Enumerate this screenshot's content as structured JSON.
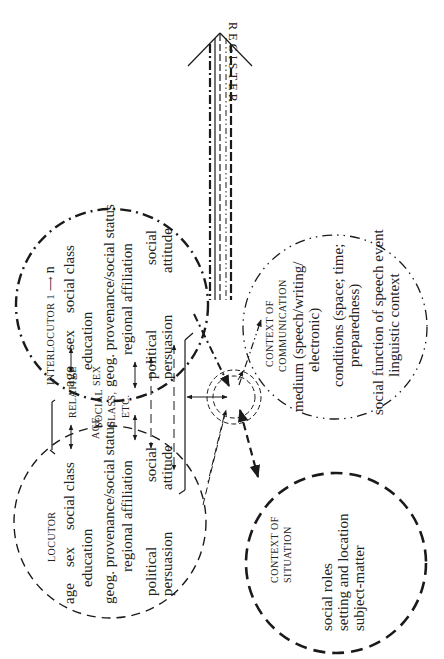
{
  "register": {
    "label_letters": [
      "R",
      "E",
      "G",
      "I",
      "S",
      "T",
      "E",
      "R"
    ],
    "label": "REGISTER"
  },
  "interlocutor": {
    "title": "INTERLOCUTOR 1",
    "title_suffix": "n",
    "row1": [
      "age",
      "sex",
      "social class"
    ],
    "row2": "education",
    "row3": "geog. provenance/social status",
    "row4": "regional affiliation",
    "row5_left": "political",
    "row5_right": "social",
    "row6_left": "persuasion",
    "row6_right": "attitude"
  },
  "locutor": {
    "title": "LOCUTOR",
    "row1": [
      "age",
      "sex",
      "social class"
    ],
    "row2": "education",
    "row3": "geog. provenance/social status",
    "row4": "regional affiliation",
    "row5_left": "political",
    "row5_right": "social",
    "row6_left": "persuasion",
    "row6_right": "attitude"
  },
  "relative": {
    "title": "RELATIVE",
    "age": "AGE",
    "sex": "SEX",
    "social_line1": "SOCIAL",
    "social_line2": "CLASS,",
    "social_line3": "ETC."
  },
  "context_communication": {
    "title_line1": "CONTEXT OF",
    "title_line2": "COMMUNICATION",
    "medium_line1": "medium (speech/writing/",
    "medium_line2": "electronic)",
    "conditions_line1": "conditions (space; time;",
    "conditions_line2": "preparedness)",
    "function_line1": "social function of speech event",
    "function_line2": "linguistic context"
  },
  "context_situation": {
    "title_line1": "CONTEXT OF",
    "title_line2": "SITUATION",
    "line1": "social roles",
    "line2": "setting and location",
    "line3": "subject-matter"
  }
}
